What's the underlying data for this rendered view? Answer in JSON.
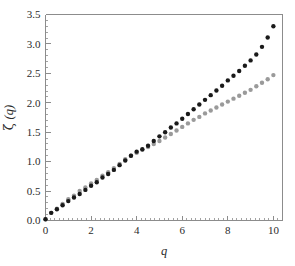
{
  "chart_data": {
    "type": "scatter",
    "title": "",
    "subtitle": "",
    "xlabel": "q",
    "ylabel": "ζ (q)",
    "ylabel_parts": {
      "greek": "ζ",
      "arg": "(q)"
    },
    "xlim": [
      0,
      10.4
    ],
    "ylim": [
      0,
      3.5
    ],
    "xticks": [
      0,
      2,
      4,
      6,
      8,
      10
    ],
    "xticklabels": [
      "0",
      "2",
      "4",
      "6",
      "8",
      "10"
    ],
    "yticks": [
      0.0,
      0.5,
      1.0,
      1.5,
      2.0,
      2.5,
      3.0,
      3.5
    ],
    "yticklabels": [
      "0.0",
      "0.5",
      "1.0",
      "1.5",
      "2.0",
      "2.5",
      "3.0",
      "3.5"
    ],
    "x_minor_tick_step": 0.2,
    "y_minor_tick_step": 0.1,
    "grid": false,
    "legend": "none",
    "frame": "left-and-bottom-and-top-partial",
    "marker_size_px": 4.4,
    "series": [
      {
        "name": "black-series",
        "color": "#1a1a1a",
        "marker": "circle",
        "x": [
          0.0,
          0.25,
          0.5,
          0.75,
          1.0,
          1.25,
          1.5,
          1.75,
          2.0,
          2.25,
          2.5,
          2.75,
          3.0,
          3.25,
          3.5,
          3.75,
          4.0,
          4.25,
          4.5,
          4.75,
          5.0,
          5.25,
          5.5,
          5.75,
          6.0,
          6.25,
          6.5,
          6.75,
          7.0,
          7.25,
          7.5,
          7.75,
          8.0,
          8.25,
          8.5,
          8.75,
          9.0,
          9.25,
          9.5,
          9.75,
          10.0
        ],
        "y": [
          0.02,
          0.13,
          0.19,
          0.26,
          0.33,
          0.39,
          0.45,
          0.52,
          0.59,
          0.65,
          0.73,
          0.79,
          0.86,
          0.94,
          1.02,
          1.1,
          1.17,
          1.21,
          1.27,
          1.35,
          1.43,
          1.5,
          1.58,
          1.65,
          1.73,
          1.81,
          1.89,
          1.97,
          2.05,
          2.13,
          2.21,
          2.29,
          2.38,
          2.46,
          2.54,
          2.63,
          2.72,
          2.82,
          2.95,
          3.11,
          3.3
        ]
      },
      {
        "name": "gray-series",
        "color": "#9a9a9a",
        "marker": "circle",
        "x": [
          0.0,
          0.25,
          0.5,
          0.75,
          1.0,
          1.25,
          1.5,
          1.75,
          2.0,
          2.25,
          2.5,
          2.75,
          3.0,
          3.25,
          3.5,
          3.75,
          4.0,
          4.25,
          4.5,
          4.75,
          5.0,
          5.25,
          5.5,
          5.75,
          6.0,
          6.25,
          6.5,
          6.75,
          7.0,
          7.25,
          7.5,
          7.75,
          8.0,
          8.25,
          8.5,
          8.75,
          9.0,
          9.25,
          9.5,
          9.75,
          10.0
        ],
        "y": [
          0.02,
          0.13,
          0.2,
          0.28,
          0.36,
          0.42,
          0.5,
          0.56,
          0.63,
          0.69,
          0.76,
          0.82,
          0.89,
          0.96,
          1.04,
          1.1,
          1.15,
          1.2,
          1.25,
          1.3,
          1.35,
          1.41,
          1.47,
          1.53,
          1.59,
          1.65,
          1.71,
          1.76,
          1.82,
          1.87,
          1.92,
          1.97,
          2.02,
          2.07,
          2.12,
          2.17,
          2.22,
          2.28,
          2.34,
          2.4,
          2.47
        ]
      }
    ]
  },
  "figure": {
    "background_color": "#ffffff",
    "axis_color": "#8c8c8c",
    "text_color": "#2b2b2b"
  }
}
